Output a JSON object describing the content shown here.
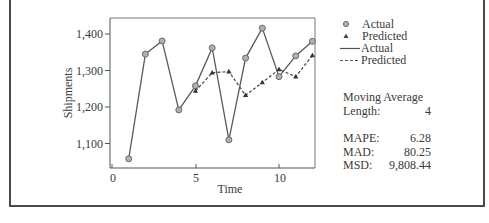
{
  "chart_data": {
    "type": "line",
    "title": "",
    "xlabel": "Time",
    "ylabel": "Shipments",
    "x": [
      1,
      2,
      3,
      4,
      5,
      6,
      7,
      8,
      9,
      10,
      11,
      12
    ],
    "series": [
      {
        "name": "Actual",
        "marker": "circle",
        "line": "solid",
        "x": [
          1,
          2,
          3,
          4,
          5,
          6,
          7,
          8,
          9,
          10,
          11,
          12
        ],
        "values": [
          1058,
          1345,
          1381,
          1192,
          1258,
          1362,
          1110,
          1334,
          1416,
          1283,
          1340,
          1380
        ]
      },
      {
        "name": "Predicted",
        "marker": "triangle",
        "line": "dashed",
        "x": [
          5,
          6,
          7,
          8,
          9,
          10,
          11,
          12
        ],
        "values": [
          1244,
          1294,
          1297,
          1232,
          1267,
          1303,
          1283,
          1341
        ]
      }
    ],
    "xticks": [
      0,
      5,
      10
    ],
    "yticks": [
      1100,
      1200,
      1300,
      1400
    ],
    "ytick_labels": [
      "1,100",
      "1,200",
      "1,300",
      "1,400"
    ],
    "xlim": [
      0,
      12.2
    ],
    "ylim": [
      1040,
      1445
    ],
    "grid": false,
    "legend_position": "right",
    "legend": [
      "Actual",
      "Predicted",
      "Actual",
      "Predicted"
    ]
  },
  "legend": {
    "items": [
      {
        "label": "Actual",
        "icon": "circle-marker"
      },
      {
        "label": "Predicted",
        "icon": "triangle-marker"
      },
      {
        "label": "Actual",
        "icon": "solid-line"
      },
      {
        "label": "Predicted",
        "icon": "dashed-line"
      }
    ]
  },
  "stats": {
    "title": "Moving Average",
    "length_label": "Length:",
    "length_value": "4",
    "mape_label": "MAPE:",
    "mape_value": "6.28",
    "mad_label": "MAD:",
    "mad_value": "80.25",
    "msd_label": "MSD:",
    "msd_value": "9,808.44"
  },
  "axes": {
    "xlabel": "Time",
    "ylabel": "Shipments",
    "xtick_labels": [
      "0",
      "5",
      "10"
    ],
    "ytick_labels": [
      "1,400",
      "1,300",
      "1,200",
      "1,100"
    ]
  },
  "colors": {
    "line": "#5a5a5a",
    "marker_fill": "#b0b0b0",
    "text": "#3a3a3a",
    "frame": "#4a4a4a"
  }
}
